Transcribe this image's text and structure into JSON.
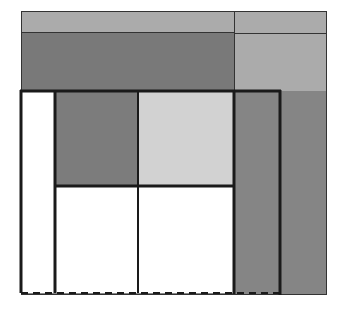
{
  "diagram": {
    "title": "",
    "colors": {
      "top_band": "#ababab",
      "dark_band": "#797979",
      "right_light": "#ababab",
      "dark_cell": "#7c7c7c",
      "light_cell": "#d2d2d2",
      "right_col": "#858585",
      "white": "#ffffff",
      "line": "#1a1a1a"
    }
  }
}
